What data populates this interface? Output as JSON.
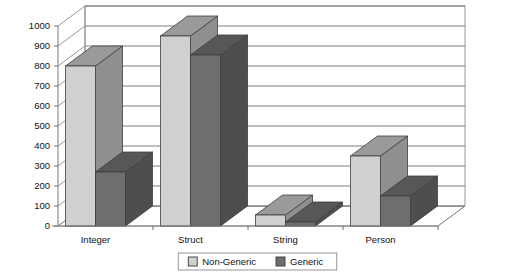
{
  "chart_data": {
    "type": "bar",
    "title": "",
    "subtitle": "",
    "xlabel": "",
    "ylabel": "",
    "categories": [
      "Integer",
      "Struct",
      "String",
      "Person"
    ],
    "series": [
      {
        "name": "Non-Generic",
        "values": [
          800,
          950,
          55,
          350
        ],
        "color": "#d0d0d0"
      },
      {
        "name": "Generic",
        "values": [
          270,
          855,
          20,
          150
        ],
        "color": "#6e6e6e"
      }
    ],
    "ylim": [
      0,
      1000
    ],
    "ytick_step": 100,
    "yticks": [
      0,
      100,
      200,
      300,
      400,
      500,
      600,
      700,
      800,
      900,
      1000
    ],
    "ytick_labels": [
      "0",
      "100",
      "200",
      "300",
      "400",
      "500",
      "600",
      "700",
      "800",
      "900",
      "1000"
    ],
    "grid": true,
    "grid_axis": "y",
    "legend_position": "bottom",
    "three_d": true
  },
  "legend": {
    "entries": [
      {
        "label": "Non-Generic",
        "swatch_face": "#d0d0d0",
        "swatch_side": "#8f8f8f"
      },
      {
        "label": "Generic",
        "swatch_face": "#6e6e6e",
        "swatch_side": "#4a4a4a"
      }
    ]
  },
  "style": {
    "background": "#ffffff",
    "plot_background": "#ffffff",
    "wall_fill": "#ffffff",
    "floor_fill": "#ffffff",
    "gridline_color": "#6f6f6f",
    "axis_color": "#7a7a7a",
    "text_color": "#111111",
    "bar_light_face": "#d0d0d0",
    "bar_light_top": "#9a9a9a",
    "bar_light_side": "#8f8f8f",
    "bar_dark_face": "#6e6e6e",
    "bar_dark_top": "#575757",
    "bar_dark_side": "#4e4e4e",
    "bar_outline": "#3d3d3d"
  }
}
